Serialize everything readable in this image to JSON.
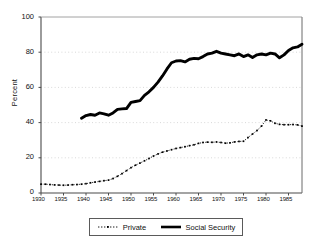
{
  "chart_data": {
    "type": "line",
    "title": "",
    "xlabel": "",
    "ylabel": "Percent",
    "xlim": [
      1930,
      1988
    ],
    "ylim": [
      0,
      100
    ],
    "ytick_labels": [
      "0",
      "20",
      "40",
      "60",
      "80",
      "100"
    ],
    "ytick_values": [
      0,
      20,
      40,
      60,
      80,
      100
    ],
    "xtick_labels": [
      "1930",
      "1935",
      "1940",
      "1945",
      "1950",
      "1955",
      "1960",
      "1965",
      "1970",
      "1975",
      "1980",
      "1985"
    ],
    "xtick_values": [
      1930,
      1935,
      1940,
      1945,
      1950,
      1955,
      1960,
      1965,
      1970,
      1975,
      1980,
      1985
    ],
    "grid": "horizontal-dotted",
    "legend_position": "bottom-center",
    "series": [
      {
        "name": "Private",
        "style": "dotted-with-markers",
        "color": "#000000",
        "x": [
          1930,
          1931,
          1932,
          1933,
          1934,
          1935,
          1936,
          1937,
          1938,
          1939,
          1940,
          1941,
          1942,
          1943,
          1944,
          1945,
          1946,
          1947,
          1948,
          1949,
          1950,
          1951,
          1952,
          1953,
          1954,
          1955,
          1956,
          1957,
          1958,
          1959,
          1960,
          1961,
          1962,
          1963,
          1964,
          1965,
          1966,
          1967,
          1968,
          1969,
          1970,
          1971,
          1972,
          1973,
          1974,
          1975,
          1976,
          1977,
          1978,
          1979,
          1980,
          1981,
          1982,
          1983,
          1984,
          1985,
          1986,
          1987,
          1988
        ],
        "values": [
          5.0,
          5.0,
          4.8,
          4.6,
          4.5,
          4.4,
          4.5,
          4.7,
          4.8,
          5.0,
          5.3,
          5.8,
          6.2,
          6.6,
          7.0,
          7.3,
          8.2,
          9.5,
          11.0,
          12.7,
          14.4,
          15.8,
          17.0,
          18.3,
          19.6,
          21.0,
          22.2,
          23.2,
          23.9,
          24.6,
          25.3,
          25.8,
          26.3,
          26.9,
          27.4,
          28.2,
          28.7,
          28.9,
          28.8,
          29.0,
          28.7,
          28.3,
          28.5,
          29.0,
          29.3,
          29.4,
          31.5,
          33.5,
          35.5,
          38.0,
          41.5,
          41.0,
          39.6,
          39.0,
          38.8,
          38.8,
          38.9,
          38.7,
          38.0
        ]
      },
      {
        "name": "Social Security",
        "style": "thick-solid",
        "color": "#000000",
        "x": [
          1939,
          1940,
          1941,
          1942,
          1943,
          1944,
          1945,
          1946,
          1947,
          1948,
          1949,
          1950,
          1951,
          1952,
          1953,
          1954,
          1955,
          1956,
          1957,
          1958,
          1959,
          1960,
          1961,
          1962,
          1963,
          1964,
          1965,
          1966,
          1967,
          1968,
          1969,
          1970,
          1971,
          1972,
          1973,
          1974,
          1975,
          1976,
          1977,
          1978,
          1979,
          1980,
          1981,
          1982,
          1983,
          1984,
          1985,
          1986,
          1987,
          1988
        ],
        "values": [
          42.5,
          44.0,
          44.6,
          44.2,
          45.5,
          45.0,
          44.2,
          45.5,
          47.5,
          47.8,
          48.0,
          51.5,
          52.0,
          52.5,
          55.5,
          57.5,
          60.0,
          63.0,
          66.5,
          70.5,
          74.0,
          75.0,
          75.2,
          74.5,
          76.0,
          76.5,
          76.3,
          77.5,
          79.0,
          79.5,
          80.5,
          79.5,
          79.0,
          78.5,
          78.0,
          79.0,
          77.5,
          78.5,
          77.0,
          78.5,
          79.0,
          78.5,
          79.5,
          79.0,
          76.8,
          78.5,
          81.0,
          82.5,
          83.0,
          84.5
        ]
      }
    ]
  },
  "legend": {
    "items": [
      {
        "label": "Private",
        "marker": "dotted"
      },
      {
        "label": "Social Security",
        "marker": "solid-thick"
      }
    ]
  }
}
